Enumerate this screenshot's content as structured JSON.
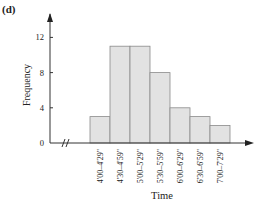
{
  "panel_label": "(d)",
  "chart_data": {
    "type": "bar",
    "subtype": "histogram",
    "title": "",
    "xlabel": "Time",
    "ylabel": "Frequency",
    "categories": [
      "4'00–4'29\"",
      "4'30–4'59\"",
      "5'00–5'29\"",
      "5'30–5'59\"",
      "6'00–6'29\"",
      "6'30–6'59\"",
      "7'00–7'29\""
    ],
    "values": [
      3,
      11,
      11,
      8,
      4,
      3,
      2
    ],
    "yticks": [
      0,
      4,
      8,
      12
    ],
    "ylim": [
      0,
      14
    ],
    "grid": false,
    "legend": null,
    "x_axis_break": true,
    "bar_color": "#e2e2e2",
    "bar_edge_color": "#8a8a8a"
  }
}
